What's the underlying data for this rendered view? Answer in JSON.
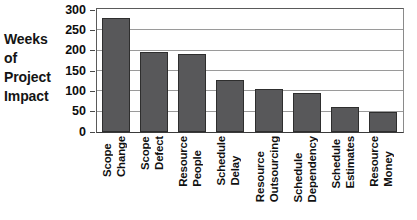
{
  "axis_caption": {
    "lines": [
      "Weeks",
      "of",
      "Project",
      "Impact"
    ]
  },
  "colors": {
    "bar_fill": "#58585a",
    "bar_stroke": "#2e2e2e",
    "gridline": "#9a9a9a",
    "axis": "#3a3a3a",
    "text": "#101010",
    "background": "#ffffff"
  },
  "chart_data": {
    "type": "bar",
    "title": "",
    "subtitle": "",
    "xlabel": "",
    "ylabel": "Weeks of Project Impact",
    "ylim": [
      0,
      300
    ],
    "ytick_interval": 50,
    "yticks": [
      "300",
      "250",
      "200",
      "150",
      "100",
      "50",
      "0"
    ],
    "grid": true,
    "legend": false,
    "legend_position": "none",
    "orientation": "vertical",
    "categories": [
      "Scope Change",
      "Scope Defect",
      "Resource People",
      "Schedule Delay",
      "Resource Outsourcing",
      "Schedule Dependency",
      "Schedule Estimates",
      "Resource Money"
    ],
    "category_words": [
      [
        "Scope",
        "Change"
      ],
      [
        "Scope",
        "Defect"
      ],
      [
        "Resource",
        "People"
      ],
      [
        "Schedule",
        "Delay"
      ],
      [
        "Resource",
        "Outsourcing"
      ],
      [
        "Schedule",
        "Dependency"
      ],
      [
        "Schedule",
        "Estimates"
      ],
      [
        "Resource",
        "Money"
      ]
    ],
    "values": [
      280,
      197,
      192,
      128,
      105,
      97,
      62,
      48
    ],
    "series": [
      {
        "name": "Weeks of Project Impact",
        "values": [
          280,
          197,
          192,
          128,
          105,
          97,
          62,
          48
        ]
      }
    ]
  }
}
